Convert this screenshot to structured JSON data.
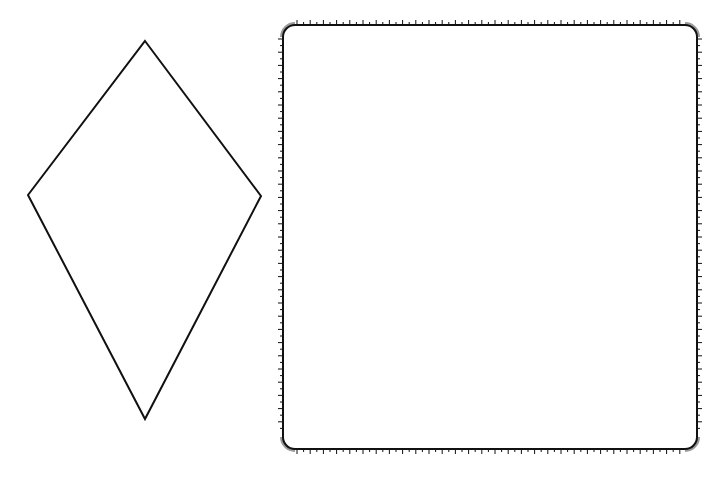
{
  "figure": {
    "background": "#ffffff",
    "stroke_color": "#111111",
    "corner_arc_color": "#9a9a9a"
  },
  "kite": {
    "label": "kite",
    "vertices": {
      "top": [
        145,
        41
      ],
      "left": [
        28,
        195
      ],
      "right": [
        261,
        196
      ],
      "bottom": [
        145,
        419
      ]
    },
    "stroke_width": 2
  },
  "square": {
    "label": "square",
    "x": 283,
    "y": 25,
    "width": 414,
    "height": 424,
    "corner_radius": 12,
    "stroke_width": 2,
    "tick_spacing": 6.6,
    "tick_long": 5,
    "tick_short": 3
  }
}
